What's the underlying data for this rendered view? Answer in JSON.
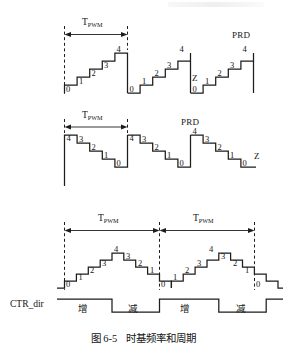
{
  "figure": {
    "caption_number": "图 6-5",
    "caption_title": "时基频率和周期",
    "caption_full": "图 6-5  时基频率和周期"
  },
  "labels": {
    "tpwm_T": "T",
    "tpwm_sub": "PWM",
    "prd": "PRD",
    "zero_mark": "Z",
    "ctr_dir": "CTR_dir",
    "dir_up": "增",
    "dir_down": "减"
  },
  "panels": [
    {
      "id": "up-count",
      "name": "asymmetric-up-count-waveform",
      "counter_values": [
        "0",
        "1",
        "2",
        "3",
        "4"
      ],
      "period_label": "T",
      "period_sublabel": "PWM",
      "prd_label": "PRD",
      "zero_label": "Z",
      "num_ramps": 3
    },
    {
      "id": "down-count",
      "name": "asymmetric-down-count-waveform",
      "counter_values": [
        "4",
        "3",
        "2",
        "1",
        "0"
      ],
      "period_label": "T",
      "period_sublabel": "PWM",
      "prd_label": "PRD",
      "zero_label": "Z",
      "num_ramps": 3
    },
    {
      "id": "up-down-count",
      "name": "symmetric-up-down-count-waveform",
      "counter_values": [
        "0",
        "1",
        "2",
        "3",
        "4",
        "3",
        "2",
        "1",
        "0"
      ],
      "period_label": "T",
      "period_sublabel": "PWM",
      "num_periods": 2
    }
  ],
  "ctr_dir_signal": {
    "label": "CTR_dir",
    "segments": [
      {
        "state": "high",
        "text": "增"
      },
      {
        "state": "low",
        "text": "减"
      },
      {
        "state": "high",
        "text": "增"
      },
      {
        "state": "low",
        "text": "减"
      },
      {
        "state": "high",
        "text": ""
      }
    ]
  },
  "colors": {
    "stroke": "#1d1d1d",
    "text": "#141414",
    "background": "#ffffff"
  },
  "numbers": {
    "p1": [
      "0",
      "1",
      "2",
      "3",
      "4",
      "0",
      "1",
      "2",
      "3",
      "4",
      "0",
      "1",
      "2",
      "3",
      "4"
    ],
    "p2": [
      "4",
      "3",
      "2",
      "1",
      "0",
      "4",
      "3",
      "2",
      "1",
      "0",
      "4",
      "3",
      "2",
      "1",
      "0"
    ],
    "p3": [
      "0",
      "1",
      "2",
      "3",
      "4",
      "3",
      "2",
      "1",
      "0",
      "1",
      "2",
      "3",
      "4",
      "3",
      "2",
      "1",
      "0"
    ]
  }
}
